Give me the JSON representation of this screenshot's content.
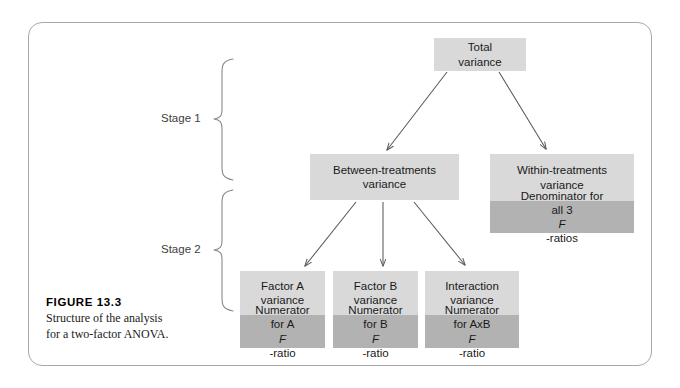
{
  "figure": {
    "number_label": "FIGURE 13.3",
    "caption_line_1": "Structure of the analysis",
    "caption_line_2": "for a two-factor ANOVA."
  },
  "stages": [
    {
      "id": "stage-1",
      "label": "Stage 1"
    },
    {
      "id": "stage-2",
      "label": "Stage 2"
    }
  ],
  "nodes": {
    "total": {
      "line_1": "Total",
      "line_2": "variance"
    },
    "between": {
      "line_1": "Between-treatments",
      "line_2": "variance"
    },
    "within": {
      "line_1": "Within-treatments",
      "line_2": "variance",
      "role_line_1": "Denominator for",
      "role_line_2_pre": "all 3 ",
      "role_line_2_italic": "F",
      "role_line_2_post": "-ratios"
    },
    "factor_a": {
      "line_1": "Factor A",
      "line_2": "variance",
      "role_line_1": "Numerator",
      "role_line_2_pre": "for A ",
      "role_line_2_italic": "F",
      "role_line_2_post": "-ratio"
    },
    "factor_b": {
      "line_1": "Factor B",
      "line_2": "variance",
      "role_line_1": "Numerator",
      "role_line_2_pre": "for B ",
      "role_line_2_italic": "F",
      "role_line_2_post": "-ratio"
    },
    "interaction": {
      "line_1": "Interaction",
      "line_2": "variance",
      "role_line_1": "Numerator",
      "role_line_2_pre": "for AxB ",
      "role_line_2_italic": "F",
      "role_line_2_post": "-ratio"
    }
  },
  "colors": {
    "box_light": "#d9d9d9",
    "box_dark": "#b2b2b2",
    "frame_border": "#a8a8a8",
    "arrow": "#595959",
    "bracket": "#8a8a8a",
    "page_background": "#ffffff"
  }
}
